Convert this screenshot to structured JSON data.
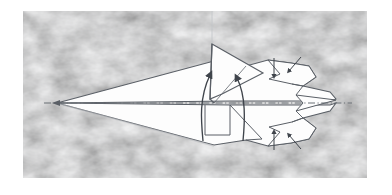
{
  "figure": {
    "kind": "origami-fold-diagram",
    "caption": "",
    "background": {
      "page_color": "#ffffff",
      "panel_color": "#e9e9e9",
      "panel_texture": "mottled-marbled-gray",
      "panel_x": 23,
      "panel_y": 11,
      "panel_width": 344,
      "panel_height": 167
    },
    "ink": {
      "outline_color": "#5a5f66",
      "fill_color": "#fdfdfd",
      "shadow_color": "#b9bcc0",
      "arrow_color": "#3f444b",
      "foldline_color": "#6b7077"
    },
    "lines": [
      {
        "name": "center-fold-line",
        "style": "dash-dot",
        "orientation": "horizontal",
        "y": 103
      },
      {
        "name": "guide-line-vertical",
        "style": "thin-solid",
        "orientation": "vertical",
        "x": 212
      }
    ],
    "arrows": [
      {
        "name": "fold-arrow-left",
        "style": "curved",
        "direction": "up",
        "from": [
          202,
          140
        ],
        "to": [
          209,
          72
        ]
      },
      {
        "name": "fold-arrow-right",
        "style": "curved",
        "direction": "up",
        "from": [
          242,
          140
        ],
        "to": [
          236,
          74
        ]
      },
      {
        "name": "tuck-arrow-top",
        "style": "straight",
        "direction": "down",
        "from": [
          274,
          58
        ],
        "to": [
          274,
          78
        ]
      },
      {
        "name": "tuck-arrow-bottom",
        "style": "straight",
        "direction": "down",
        "from": [
          274,
          130
        ],
        "to": [
          274,
          150
        ]
      },
      {
        "name": "tuck-arrow-upper-right",
        "style": "straight",
        "direction": "down-left",
        "from": [
          300,
          58
        ],
        "to": [
          288,
          72
        ]
      },
      {
        "name": "tuck-arrow-lower-right",
        "style": "straight",
        "direction": "up-left",
        "from": [
          300,
          148
        ],
        "to": [
          288,
          134
        ]
      }
    ],
    "shapes": [
      {
        "name": "plane-body-upper",
        "note": "long tapered wing from nose tip to tail"
      },
      {
        "name": "plane-body-lower",
        "note": "mirror wing below the center fold line"
      },
      {
        "name": "raised-fin-flap",
        "note": "tall triangular flap standing up from the spine"
      },
      {
        "name": "tail-assembly",
        "note": "stepped tail panels at right"
      },
      {
        "name": "nose-tip",
        "position": "left"
      },
      {
        "name": "tail-tip",
        "position": "right"
      }
    ]
  }
}
